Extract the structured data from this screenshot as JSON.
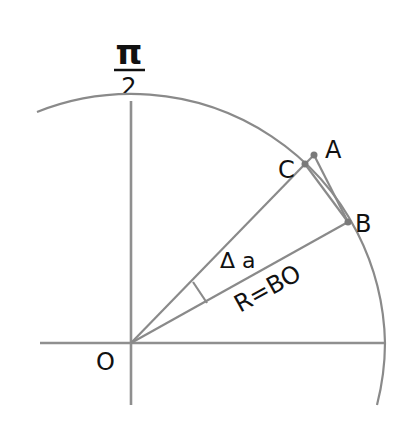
{
  "diagram": {
    "title_fraction": {
      "numerator": "π",
      "denominator": "2"
    },
    "labels": {
      "origin": "O",
      "point_a": "A",
      "point_b": "B",
      "point_c": "C",
      "angle": "Δ a",
      "radius": "R=BO"
    },
    "colors": {
      "lines": "#8a8a8a",
      "text": "#111111",
      "points": "#7a7a7a",
      "background": "#ffffff"
    }
  }
}
